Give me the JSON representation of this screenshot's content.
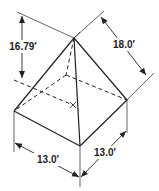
{
  "figure": {
    "type": "pyramid-dimension-drawing",
    "stroke_color": "#222222",
    "background": "#ffffff",
    "dimensions": {
      "vertical_height": "16.79′",
      "slant_edge": "18.0′",
      "base_left": "13.0′",
      "base_right": "13.0′"
    }
  }
}
